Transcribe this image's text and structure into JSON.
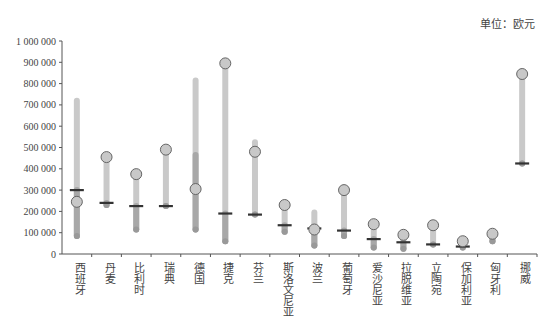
{
  "unit_label": "单位：欧元",
  "chart_data": {
    "type": "range-dot",
    "title": "",
    "unit": "欧元",
    "ylabel": "",
    "xlabel": "",
    "ylim": [
      0,
      1000000
    ],
    "yticks": [
      "0",
      "100 000",
      "200 000",
      "300 000",
      "400 000",
      "500 000",
      "600 000",
      "700 000",
      "800 000",
      "900 000",
      "1 000 000"
    ],
    "grid": false,
    "legend": null,
    "categories": [
      "西班牙",
      "丹麦",
      "比利时",
      "瑞典",
      "德国",
      "捷克",
      "芬兰",
      "斯洛文尼亚",
      "波兰",
      "葡萄牙",
      "爱沙尼亚",
      "拉脱维亚",
      "立陶宛",
      "保加利亚",
      "匈牙利",
      "挪威"
    ],
    "series": [
      {
        "name": "range_max",
        "values": [
          720000,
          455000,
          375000,
          490000,
          815000,
          895000,
          525000,
          230000,
          195000,
          300000,
          140000,
          90000,
          135000,
          60000,
          95000,
          845000
        ]
      },
      {
        "name": "range_min",
        "values": [
          85000,
          230000,
          115000,
          225000,
          115000,
          60000,
          185000,
          105000,
          40000,
          85000,
          30000,
          25000,
          45000,
          30000,
          60000,
          425000
        ]
      },
      {
        "name": "marker_bar",
        "values": [
          300000,
          240000,
          225000,
          225000,
          null,
          190000,
          185000,
          135000,
          120000,
          110000,
          70000,
          55000,
          45000,
          35000,
          null,
          425000
        ]
      },
      {
        "name": "highlight_circle",
        "values": [
          245000,
          455000,
          375000,
          490000,
          305000,
          895000,
          480000,
          230000,
          115000,
          300000,
          140000,
          90000,
          135000,
          60000,
          95000,
          845000
        ]
      }
    ]
  }
}
